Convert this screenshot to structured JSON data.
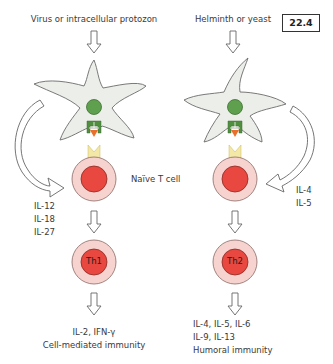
{
  "figure": {
    "number": "22.4"
  },
  "left_pathway": {
    "stimulus": "Virus or intracellular protozon",
    "cytokines_in": [
      "IL-12",
      "IL-18",
      "IL-27"
    ],
    "differentiated_cell": "Th1",
    "output_line1": "IL-2,  IFN-γ",
    "output_line2": "Cell-mediated immunity"
  },
  "right_pathway": {
    "stimulus": "Helminth or yeast",
    "cytokines_in": [
      "IL-4",
      "IL-5"
    ],
    "differentiated_cell": "Th2",
    "output_line1": "IL-4, IL-5, IL-6",
    "output_line2": "IL-9, IL-13",
    "output_line3": "Humoral immunity"
  },
  "shared": {
    "naive_cell_label": "Naïve T cell"
  },
  "colors": {
    "dendritic_cell_fill": "#eceee9",
    "dendritic_cell_stroke": "#6b6b6b",
    "nucleus_green": "#5fa04e",
    "mhc_green": "#4f8f3f",
    "antigen_orange": "#e8702a",
    "tcr_yellow": "#f3e8a6",
    "tcell_outer": "#f6d3cf",
    "tcell_inner": "#e8483f",
    "arrow_stroke": "#666666"
  }
}
